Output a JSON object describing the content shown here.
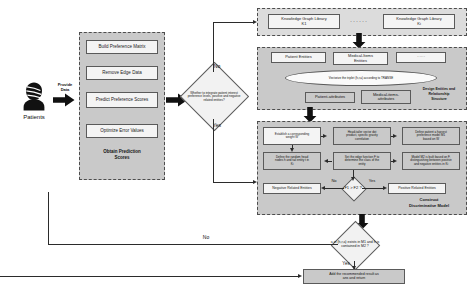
{
  "diagram": {
    "colors": {
      "group_fill": "#c9c9c9",
      "group_fill_light": "#dcdcdc",
      "box_fill": "#f4f4f4",
      "box_border": "#5a5a5a",
      "arrow": "#2b2b2b"
    }
  },
  "source": {
    "actor_label": "Patients",
    "actor_icon": "patient-person-icon",
    "provide_data_label_line1": "Provide",
    "provide_data_label_line2": "Data"
  },
  "prediction_group": {
    "label_line1": "Obtain Prediction",
    "label_line2": "Scores",
    "steps": [
      {
        "label": "Build Preference Matrix"
      },
      {
        "label": "Remove Edge Data"
      },
      {
        "label": "Predict Preference Scores"
      },
      {
        "label": "Optimize Error Values"
      }
    ]
  },
  "integrate_decision": {
    "text": "Whether to integrate patient interest preference levels, positive and negative related entities?",
    "branch_no": "No",
    "branch_yes": "Yes"
  },
  "kg_group": {
    "boxes": [
      {
        "line1": "Knowledge Graph Library",
        "line2": "K1"
      },
      {
        "line1": "Knowledge Graph Library",
        "line2": "Ki"
      }
    ],
    "ellipsis": "······"
  },
  "entity_group": {
    "label_line1": "Design Entities and",
    "label_line2": "Relationship",
    "label_line3": "Structure",
    "top_boxes": [
      {
        "line1": "Patient Entities",
        "line2": ""
      },
      {
        "line1": "Medical-Items",
        "line2": "Entities"
      },
      {
        "line1": "······",
        "line2": ""
      }
    ],
    "ellipse_text": "Vectorize the triplet (h,r,a) according to TRANSE",
    "bottom_boxes": [
      {
        "label": "Patient-attributes"
      },
      {
        "line1": "Medical-items-",
        "line2": "attributes"
      }
    ]
  },
  "discriminative_group": {
    "label_line1": "Construct",
    "label_line2": "Discriminative Model",
    "row1": [
      {
        "line1": "Establish a corresponding",
        "line2": "weight W"
      },
      {
        "line1": "Head-tailer vector dot",
        "line2": "product, specific gravity",
        "line3": "correlation"
      },
      {
        "line1": "Define patient a harvest",
        "line2": "preference model M1",
        "line3": "based on  W"
      }
    ],
    "row2": [
      {
        "line1": "Define the random head",
        "line2": "nodes h and tail entity t in",
        "line3": "Ki"
      },
      {
        "line1": "Set the edge function F to",
        "line2": "determine the class of the",
        "line3": "entity"
      },
      {
        "line1": "Model M2 is built based on F,",
        "line2": "distinguishing between positive",
        "line3": "and negative entities in Ki"
      }
    ],
    "compare_decision": {
      "text": "F1 > F2 ?",
      "branch_no": "No",
      "branch_yes": "Yes"
    },
    "negative_box": "Negative Related Entities",
    "positive_box": "Positive Related Entities"
  },
  "final_decision": {
    "line1": "a in (h,r,a) exists in M1 and h is",
    "line2": "contained in M2 ?",
    "branch_no": "No",
    "branch_yes": "Yes"
  },
  "result_box": {
    "line1": "Add the recommended result as",
    "line2": "ans and return"
  }
}
